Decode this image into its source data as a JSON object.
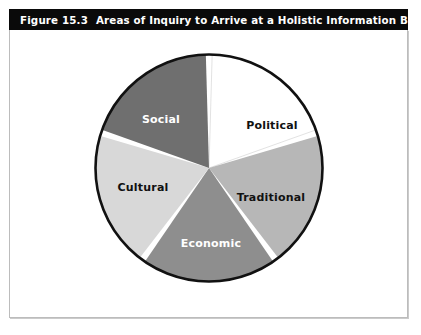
{
  "figure": {
    "number": "Figure 15.3",
    "caption": "Areas of Inquiry to Arrive at a Holistic Information Base",
    "full_caption": "Figure 15.3   Areas of Inquiry to Arrive at a Holistic Information Base"
  },
  "colors": {
    "caption_bar_bg": "#0a0a0a",
    "caption_text": "#ffffff",
    "panel_bg": "#ffffff",
    "panel_border": "#bcbcbc",
    "pie_outline": "#111111",
    "slice_divider": "#ffffff"
  },
  "chart_data": {
    "type": "pie",
    "title": "Areas of Inquiry to Arrive at a Holistic Information Base",
    "xlabel": "",
    "ylabel": "",
    "legend": "none",
    "grid": false,
    "start_angle_deg": 0,
    "direction": "clockwise",
    "labels": [
      "Political",
      "Traditional",
      "Economic",
      "Cultural",
      "Social"
    ],
    "values": [
      20,
      20,
      20,
      20,
      20
    ],
    "slice_angle_deg": 72,
    "slices": [
      {
        "label": "Political",
        "value": 20,
        "angle_deg": 72,
        "start_deg": 0,
        "end_deg": 72,
        "fill": "#ffffff",
        "text_color": "#111111",
        "label_x": 63,
        "label_y": -42
      },
      {
        "label": "Traditional",
        "value": 20,
        "angle_deg": 72,
        "start_deg": 72,
        "end_deg": 144,
        "fill": "#b7b7b7",
        "text_color": "#111111",
        "label_x": 62,
        "label_y": 30
      },
      {
        "label": "Economic",
        "value": 20,
        "angle_deg": 72,
        "start_deg": 144,
        "end_deg": 216,
        "fill": "#8e8e8e",
        "text_color": "#ffffff",
        "label_x": 2,
        "label_y": 76
      },
      {
        "label": "Cultural",
        "value": 20,
        "angle_deg": 72,
        "start_deg": 216,
        "end_deg": 288,
        "fill": "#d8d8d8",
        "text_color": "#111111",
        "label_x": -66,
        "label_y": 20
      },
      {
        "label": "Social",
        "value": 20,
        "angle_deg": 72,
        "start_deg": 288,
        "end_deg": 360,
        "fill": "#6f6f6f",
        "text_color": "#ffffff",
        "label_x": -48,
        "label_y": -48
      }
    ]
  }
}
